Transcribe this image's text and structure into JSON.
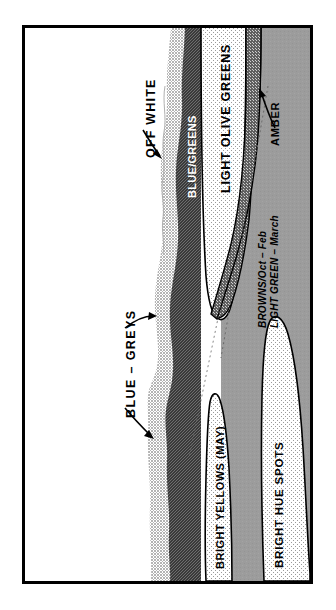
{
  "figure": {
    "type": "color-zone-cross-section-diagram",
    "orientation": "labels rotated 90 degrees counter-clockwise",
    "frame_color": "#000000",
    "background": "#ffffff"
  },
  "labels": {
    "off_white": "OFF WHITE",
    "blue_greens": "BLUE/GREENS",
    "light_olive_greens": "LIGHT OLIVE GREENS",
    "amber": "AMBER",
    "blue_greys": "BLUE – GREYS",
    "bright_yellows": "BRIGHT YELLOWS (MAY)",
    "bright_hue_spots": "BRIGHT HUE SPOTS",
    "seasonal_note_line1": "BROWNS/Oct – Feb",
    "seasonal_note_line2": "LIGHT GREEN – March"
  },
  "zones": [
    {
      "name": "off-white",
      "fill": "#ffffff",
      "pattern": "solid"
    },
    {
      "name": "blue-greys",
      "fill": "#c8c8c8",
      "pattern": "fine-dither"
    },
    {
      "name": "blue-greens",
      "fill": "#4a4a4a",
      "pattern": "dark-checker"
    },
    {
      "name": "light-olive-greens",
      "fill": "#ececec",
      "pattern": "sparse-dots"
    },
    {
      "name": "amber",
      "fill": "#6e6e6e",
      "pattern": "medium-checker"
    },
    {
      "name": "browns-light-green",
      "fill": "#9c9c9c",
      "pattern": "solid-grey"
    },
    {
      "name": "bright-yellows",
      "fill": "#e8e8e8",
      "pattern": "sparse-dots"
    },
    {
      "name": "bright-hue-spots",
      "fill": "#e8e8e8",
      "pattern": "sparse-dots"
    }
  ],
  "colors": {
    "white": "#ffffff",
    "light_dither": "#c8c8c8",
    "dark_checker": "#4a4a4a",
    "very_light_dots": "#ececec",
    "medium_grey": "#9c9c9c",
    "amber_band": "#6e6e6e",
    "outline": "#000000",
    "dashed_line": "#6a6a6a"
  },
  "annotations": {
    "leader_lines": [
      {
        "label": "OFF WHITE",
        "arrow": "points to off-white / blue-grey boundary"
      },
      {
        "label": "BLUE – GREYS",
        "arrow": "two arrows pointing to light dither band"
      },
      {
        "label": "AMBER",
        "arrow": "points up-left to dark amber band"
      }
    ]
  }
}
